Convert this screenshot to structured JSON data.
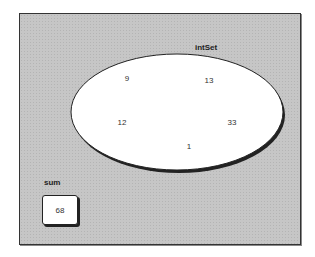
{
  "diagram": {
    "set": {
      "label": "intSet",
      "elements": [
        {
          "value": "9",
          "x": 127,
          "y": 78
        },
        {
          "value": "13",
          "x": 209,
          "y": 80
        },
        {
          "value": "12",
          "x": 122,
          "y": 122
        },
        {
          "value": "33",
          "x": 232,
          "y": 122
        },
        {
          "value": "1",
          "x": 189,
          "y": 146
        }
      ]
    },
    "sum": {
      "label": "sum",
      "value": "68"
    },
    "colors": {
      "background": "#c6c6c6",
      "set_fill": "#ffffff",
      "outline": "#222222"
    }
  }
}
